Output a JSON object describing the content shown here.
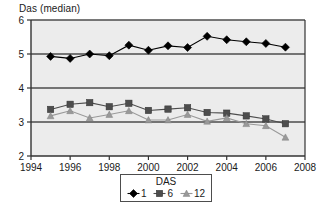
{
  "axis_label_y": "Das (median)",
  "legend": {
    "title": "DAS",
    "entries": [
      {
        "label": "1",
        "marker": "diamond-marker-icon",
        "color": "#000000"
      },
      {
        "label": "6",
        "marker": "square-marker-icon",
        "color": "#4d4d4d"
      },
      {
        "label": "12",
        "marker": "triangle-marker-icon",
        "color": "#999999"
      }
    ]
  },
  "chart_data": {
    "type": "line",
    "title": "",
    "xlabel": "",
    "ylabel": "Das (median)",
    "xlim": [
      1994,
      2008
    ],
    "ylim": [
      2,
      6
    ],
    "xticks": [
      1994,
      1996,
      1998,
      2000,
      2002,
      2004,
      2006,
      2008
    ],
    "yticks": [
      2,
      3,
      4,
      5,
      6
    ],
    "grid": true,
    "legend_position": "bottom",
    "legend_title": "DAS",
    "x": [
      1995,
      1996,
      1997,
      1998,
      1999,
      2000,
      2001,
      2002,
      2003,
      2004,
      2005,
      2006,
      2007
    ],
    "series": [
      {
        "name": "1",
        "marker": "diamond",
        "color": "#000000",
        "values": [
          4.93,
          4.87,
          5.0,
          4.95,
          5.26,
          5.11,
          5.24,
          5.19,
          5.52,
          5.42,
          5.36,
          5.31,
          5.2
        ]
      },
      {
        "name": "6",
        "marker": "square",
        "color": "#4d4d4d",
        "values": [
          3.37,
          3.52,
          3.57,
          3.45,
          3.55,
          3.34,
          3.38,
          3.42,
          3.28,
          3.26,
          3.18,
          3.09,
          2.95
        ]
      },
      {
        "name": "12",
        "marker": "triangle",
        "color": "#999999",
        "values": [
          3.18,
          3.33,
          3.12,
          3.22,
          3.33,
          3.06,
          3.06,
          3.22,
          3.02,
          3.12,
          2.95,
          2.89,
          2.55
        ]
      }
    ]
  }
}
